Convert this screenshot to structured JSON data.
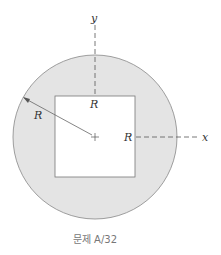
{
  "figure": {
    "labels": {
      "y_axis": "y",
      "x_axis": "x",
      "square_top": "R",
      "square_right": "R",
      "circle_radius": "R"
    },
    "caption": "문제 A/32",
    "colors": {
      "shaded": "#e4e4e4",
      "outline": "#777777",
      "dash": "#555555"
    }
  }
}
